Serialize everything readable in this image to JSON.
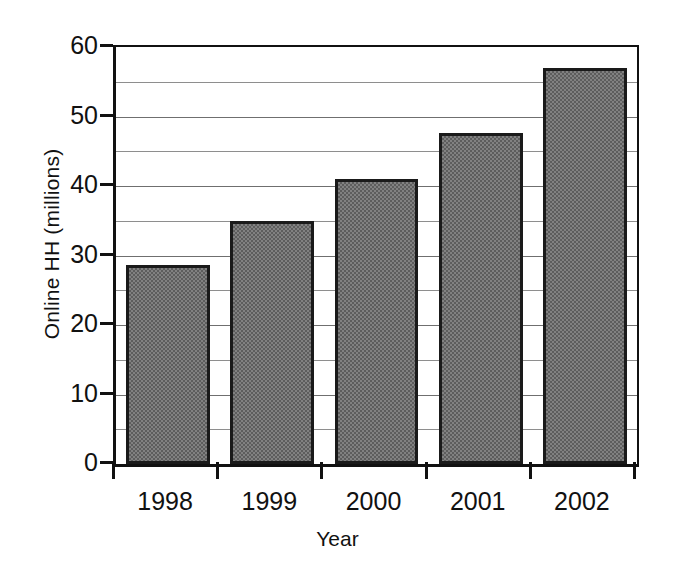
{
  "chart_data": {
    "type": "bar",
    "title": "",
    "xlabel": "Year",
    "ylabel": "Online HH (millions)",
    "categories": [
      "1998",
      "1999",
      "2000",
      "2001",
      "2002"
    ],
    "values": [
      28.6,
      35.0,
      41.0,
      47.6,
      57.0
    ],
    "ylim": [
      0,
      60
    ],
    "ytick_labels": [
      "0",
      "10",
      "20",
      "30",
      "40",
      "50",
      "60"
    ],
    "ytick_values": [
      0,
      10,
      20,
      30,
      40,
      50,
      60
    ],
    "minor_gridline_values": [
      5,
      15,
      25,
      35,
      45,
      55
    ],
    "grid": "horizontal",
    "legend": "none",
    "series": [
      {
        "name": "Online HH (millions)",
        "values": [
          28.6,
          35.0,
          41.0,
          47.6,
          57.0
        ]
      }
    ],
    "bar_fill_color": "#6e6e6e",
    "bar_edge_color": "#1a1a1a",
    "axis_color": "#111111",
    "gridline_color": "#8e8e8e",
    "background_color": "#ffffff"
  }
}
